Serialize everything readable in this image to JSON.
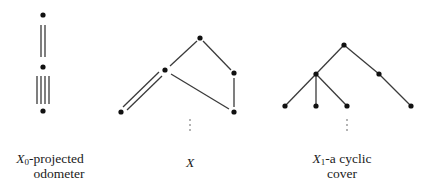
{
  "diagrams": [
    {
      "id": "projected-odometer",
      "caption_line1_var": "X",
      "caption_line1_sub": "0",
      "caption_line1_rest": "-projected",
      "caption_line2": "odometer",
      "nodes": [
        [
          43,
          15
        ],
        [
          43,
          67
        ],
        [
          43,
          111
        ]
      ],
      "edges": [
        {
          "from": 0,
          "to": 1,
          "multiplicity": 2
        },
        {
          "from": 1,
          "to": 2,
          "multiplicity": 4
        }
      ]
    },
    {
      "id": "graph-X",
      "caption_var": "X",
      "nodes": [
        [
          121,
          112
        ],
        [
          165,
          70
        ],
        [
          200,
          38
        ],
        [
          234,
          73
        ],
        [
          234,
          112
        ]
      ],
      "edges": [
        {
          "from": 0,
          "to": 1,
          "multiplicity": 2
        },
        {
          "from": 1,
          "to": 2,
          "multiplicity": 1
        },
        {
          "from": 2,
          "to": 3,
          "multiplicity": 1
        },
        {
          "from": 3,
          "to": 4,
          "multiplicity": 1
        },
        {
          "from": 1,
          "to": 4,
          "multiplicity": 1
        }
      ],
      "ellipsis": "⋮"
    },
    {
      "id": "cyclic-cover",
      "caption_line1_var": "X",
      "caption_line1_sub": "1",
      "caption_line1_rest": "-a cyclic",
      "caption_line2": "cover",
      "nodes": [
        [
          344,
          45
        ],
        [
          316,
          74
        ],
        [
          379,
          74
        ],
        [
          285,
          106
        ],
        [
          316,
          106
        ],
        [
          347,
          106
        ],
        [
          411,
          106
        ]
      ],
      "edges": [
        {
          "from": 0,
          "to": 1,
          "multiplicity": 1
        },
        {
          "from": 0,
          "to": 2,
          "multiplicity": 1
        },
        {
          "from": 1,
          "to": 3,
          "multiplicity": 1
        },
        {
          "from": 1,
          "to": 4,
          "multiplicity": 1
        },
        {
          "from": 1,
          "to": 5,
          "multiplicity": 1
        },
        {
          "from": 2,
          "to": 6,
          "multiplicity": 1
        }
      ],
      "ellipsis": "⋮"
    }
  ],
  "colors": {
    "stroke": "#3a3a3a",
    "node": "#111111",
    "text": "#1a1a1a"
  }
}
